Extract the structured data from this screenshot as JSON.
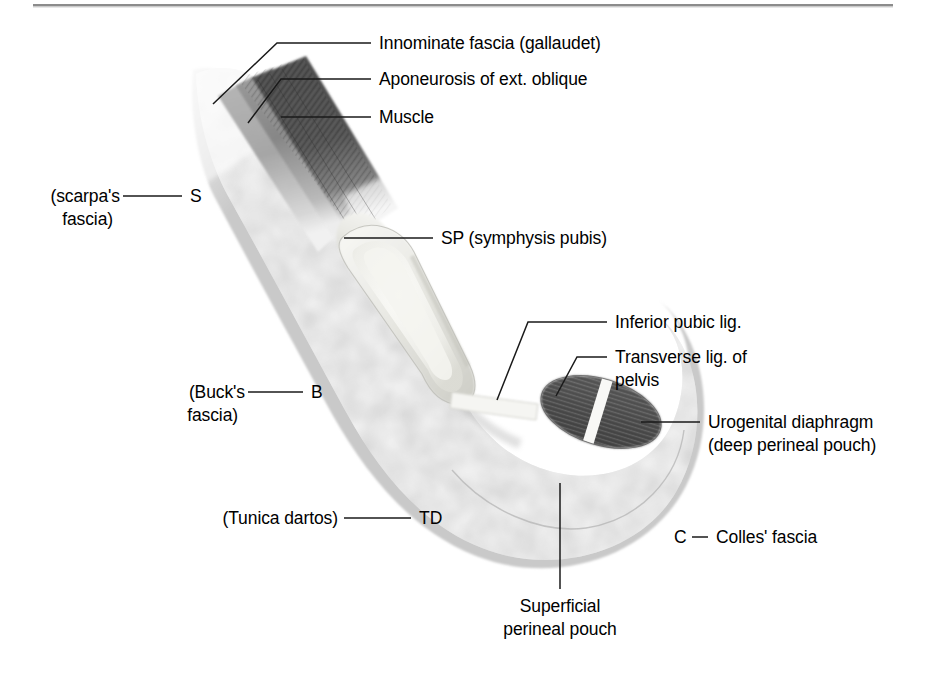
{
  "figure": {
    "top_rule": true
  },
  "colors": {
    "background": "#ffffff",
    "text": "#000000",
    "leader_line": "#1a1a1a",
    "rule": "#8c8c8c",
    "fat_tissue": "#c9c9c9",
    "fat_highlight": "#ececec",
    "muscle_dark": "#4a4a4a",
    "muscle_mid": "#6e6e6e",
    "aponeurosis": "#8f8f8f",
    "symphysis_light": "#ededea",
    "symphysis_ring": "#d9d9d2",
    "diaphragm": "#545454",
    "ligament_white": "#f7f7f5"
  },
  "labels": {
    "innominate_fascia": "Innominate fascia (gallaudet)",
    "aponeurosis": "Aponeurosis of ext. oblique",
    "muscle": "Muscle",
    "symphysis_pubis": "SP (symphysis pubis)",
    "inferior_pubic_lig": "Inferior pubic lig.",
    "transverse_lig_line1": "Transverse lig. of",
    "transverse_lig_line2": "pelvis",
    "urogenital_line1": "Urogenital diaphragm",
    "urogenital_line2": "(deep perineal pouch)",
    "scarpas_line1": "(scarpa's",
    "scarpas_line2": "fascia)",
    "bucks_line1": "(Buck's",
    "bucks_line2": "fascia)",
    "tunica_dartos": "(Tunica dartos)",
    "colles_fascia": "Colles' fascia",
    "superficial_line1": "Superficial",
    "superficial_line2": "perineal pouch"
  },
  "markers": {
    "scarpa": "S",
    "buck": "B",
    "tunica_dartos": "TD",
    "colles": "C",
    "colles_dash": "—"
  }
}
